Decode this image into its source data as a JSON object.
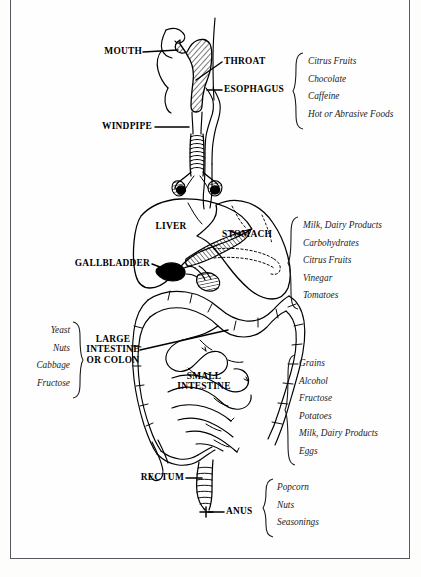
{
  "diagram": {
    "type": "anatomical-diagram",
    "frame_color": "#565a60",
    "background_color": "#fdfdfc",
    "ink_color": "#000000"
  },
  "organs": [
    {
      "name": "mouth",
      "label": "MOUTH"
    },
    {
      "name": "throat",
      "label": "THROAT"
    },
    {
      "name": "esophagus",
      "label": "ESOPHAGUS"
    },
    {
      "name": "windpipe",
      "label": "WINDPIPE"
    },
    {
      "name": "liver",
      "label": "LIVER"
    },
    {
      "name": "stomach",
      "label": "STOMACH"
    },
    {
      "name": "gallbladder",
      "label": "GALLBLADDER"
    },
    {
      "name": "large-intestine",
      "label_line1": "LARGE",
      "label_line2": "INTESTINE",
      "label_line3": "OR COLON"
    },
    {
      "name": "small-intestine",
      "label_line1": "SMALL",
      "label_line2": "INTESTINE"
    },
    {
      "name": "rectum",
      "label": "RECTUM"
    },
    {
      "name": "anus",
      "label": "ANUS"
    }
  ],
  "food_lists": [
    {
      "name": "esophagus-irritants",
      "side": "right",
      "items": [
        "Citrus Fruits",
        "Chocolate",
        "Caffeine",
        "Hot or Abrasive Foods"
      ]
    },
    {
      "name": "stomach-irritants",
      "side": "right",
      "items": [
        "Milk, Dairy Products",
        "Carbohydrates",
        "Citrus Fruits",
        "Vinegar",
        "Tomatoes"
      ]
    },
    {
      "name": "large-intestine-irritants",
      "side": "left",
      "items": [
        "Yeast",
        "Nuts",
        "Cabbage",
        "Fructose"
      ]
    },
    {
      "name": "small-intestine-irritants",
      "side": "right",
      "items": [
        "Grains",
        "Alcohol",
        "Fructose",
        "Potatoes",
        "Milk, Dairy Products",
        "Eggs"
      ]
    },
    {
      "name": "anus-irritants",
      "side": "right",
      "items": [
        "Popcorn",
        "Nuts",
        "Seasonings"
      ]
    }
  ]
}
